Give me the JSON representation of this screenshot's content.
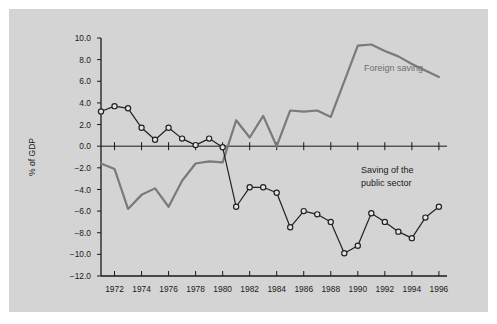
{
  "figure": {
    "background_color": "#ffffff",
    "panel_color": "#d4d4d4"
  },
  "chart_data": {
    "type": "line",
    "title": "",
    "xlabel": "",
    "ylabel": "% of GDP",
    "xlim": [
      1971,
      1996.6
    ],
    "ylim": [
      -12.0,
      10.0
    ],
    "grid": false,
    "legend_position": "inline-annotation",
    "x_ticks": [
      1972,
      1974,
      1976,
      1978,
      1980,
      1982,
      1984,
      1986,
      1988,
      1990,
      1992,
      1994,
      1996
    ],
    "x_tick_labels": [
      "1972",
      "1974",
      "1976",
      "1978",
      "1980",
      "1982",
      "1984",
      "1986",
      "1988",
      "1990",
      "1992",
      "1994",
      "1996"
    ],
    "y_ticks": [
      10.0,
      8.0,
      6.0,
      4.0,
      2.0,
      0.0,
      -2.0,
      -4.0,
      -6.0,
      -8.0,
      -10.0,
      -12.0
    ],
    "y_tick_labels": [
      "10.0",
      "8.0",
      "6.0",
      "4.0",
      "2.0",
      "0.0",
      "-2.0",
      "-4.0",
      "-6.0",
      "-8.0",
      "-10.0",
      "-12.0"
    ],
    "series": [
      {
        "name": "Saving of the public sector",
        "color": "#222222",
        "marker": "open-circle",
        "annotation": "Saving of the\npublic sector",
        "annotation_line1": "Saving of the",
        "annotation_line2": "public sector",
        "x": [
          1971,
          1972,
          1973,
          1974,
          1975,
          1976,
          1977,
          1978,
          1979,
          1980,
          1981,
          1982,
          1983,
          1984,
          1985,
          1986,
          1987,
          1988,
          1989,
          1990,
          1991,
          1992,
          1993,
          1994,
          1995,
          1996
        ],
        "values": [
          3.2,
          3.7,
          3.5,
          1.7,
          0.6,
          1.7,
          0.7,
          0.1,
          0.7,
          -0.1,
          -5.6,
          -3.8,
          -3.8,
          -4.3,
          -7.5,
          -6.0,
          -6.3,
          -7.0,
          -9.9,
          -9.2,
          -6.2,
          -7.0,
          -7.9,
          -8.5,
          -6.6,
          -5.6
        ]
      },
      {
        "name": "Foreign saving",
        "color": "#7a7a7a",
        "marker": "none",
        "annotation": "Foreign saving",
        "x": [
          1971,
          1972,
          1973,
          1974,
          1975,
          1976,
          1977,
          1978,
          1979,
          1980,
          1981,
          1982,
          1983,
          1984,
          1985,
          1986,
          1987,
          1988,
          1989,
          1990,
          1991,
          1992,
          1993,
          1994,
          1995,
          1996
        ],
        "values": [
          -1.6,
          -2.1,
          -5.8,
          -4.5,
          -3.9,
          -5.6,
          -3.2,
          -1.6,
          -1.4,
          -1.5,
          2.4,
          0.8,
          2.8,
          0.0,
          3.3,
          3.2,
          3.3,
          2.7,
          6.0,
          9.3,
          9.4,
          8.8,
          8.3,
          7.6,
          7.0,
          6.4
        ]
      }
    ]
  }
}
